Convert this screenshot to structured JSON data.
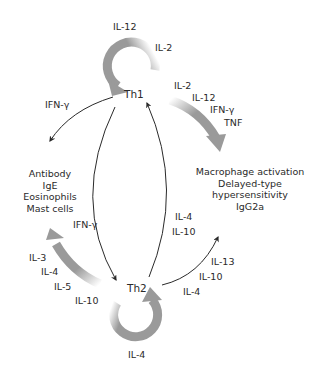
{
  "nodes": {
    "th1": "Th1",
    "th2": "Th2"
  },
  "th1_self_loop": {
    "labels": [
      "IL-12",
      "IL-2"
    ]
  },
  "th1_outputs": {
    "labels": [
      "IL-2",
      "IL-12",
      "IFN-γ",
      "TNF"
    ],
    "effects": [
      "Macrophage activation",
      "Delayed-type hypersensitivity",
      "IgG2a"
    ]
  },
  "th1_to_th2_effects": {
    "label": "IFN-γ"
  },
  "th1_inhibits_left": {
    "label": "IFN-γ"
  },
  "th2_effects": [
    "Antibody",
    "IgE",
    "Eosinophils",
    "Mast cells"
  ],
  "th2_outputs_left": {
    "labels": [
      "IL-3",
      "IL-4",
      "IL-5",
      "IL-10"
    ]
  },
  "th2_to_th1": {
    "labels": [
      "IL-4",
      "IL-10"
    ]
  },
  "th2_outputs_right": {
    "labels": [
      "IL-13",
      "IL-10",
      "IL-4"
    ]
  },
  "th2_self_loop": {
    "labels": [
      "IL-4"
    ]
  },
  "colors": {
    "thick_arrow": "#9a9a9a",
    "thin_arrow": "#2a2a2a",
    "text": "#2a2a2a"
  }
}
